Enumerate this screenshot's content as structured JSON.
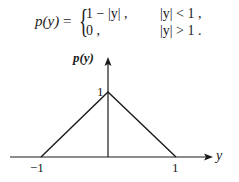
{
  "formula": {
    "lhs": "p(y)",
    "equals": "=",
    "cases": [
      {
        "expr": "1 − |y| ,",
        "condition": "|y| < 1 ,"
      },
      {
        "expr": "0 ,",
        "condition": "|y| > 1 ."
      }
    ]
  },
  "diagram": {
    "y_axis_label": "p(y)",
    "x_axis_label": "y",
    "peak_label": "1",
    "tick_labels": [
      "−1",
      "1"
    ],
    "shape": "triangle",
    "points": [
      [
        -1,
        0
      ],
      [
        0,
        1
      ],
      [
        1,
        0
      ]
    ],
    "line_color": "#1a1a1a"
  }
}
